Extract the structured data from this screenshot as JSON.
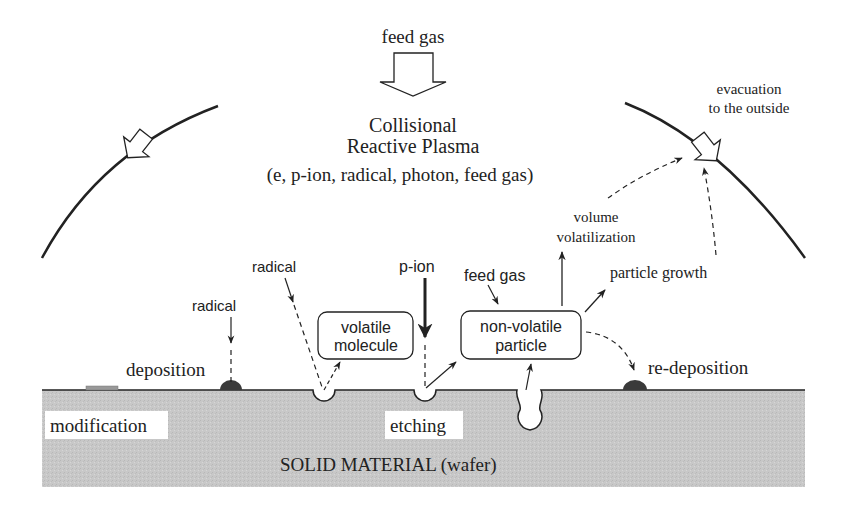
{
  "top": {
    "feed_gas": "feed gas",
    "plasma_line1": "Collisional",
    "plasma_line2": "Reactive Plasma",
    "plasma_species": "(e, p-ion, radical, photon, feed gas)"
  },
  "evacuation": {
    "line1": "evacuation",
    "line2": "to the outside"
  },
  "labels": {
    "radical_left": "radical",
    "radical_center": "radical",
    "p_ion": "p-ion",
    "feed_gas_small": "feed gas",
    "volume_line1": "volume",
    "volume_line2": "volatilization",
    "particle_growth": "particle growth",
    "deposition": "deposition",
    "re_deposition": "re-deposition",
    "modification": "modification",
    "etching": "etching",
    "solid_material": "SOLID MATERIAL  (wafer)"
  },
  "boxes": {
    "volatile_line1": "volatile",
    "volatile_line2": "molecule",
    "nonvolatile_line1": "non-volatile",
    "nonvolatile_line2": "particle"
  },
  "colors": {
    "wafer": "#c8c8c8",
    "line": "#222222",
    "deposit": "#3a3a3a"
  }
}
